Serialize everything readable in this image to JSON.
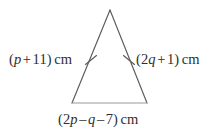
{
  "figure": {
    "type": "geometry-diagram",
    "shape": "isosceles-triangle",
    "background_color": "#ffffff",
    "side_stroke_color": "#5a5a5a",
    "base_stroke_color": "#9a9a9a",
    "text_color": "#2e2e2e",
    "vertices": {
      "apex": [
        110,
        10
      ],
      "bottom_left": [
        72,
        103
      ],
      "bottom_right": [
        147,
        103
      ]
    },
    "tick_marks": [
      {
        "name": "left-side-congruence-tick",
        "position": [
          91,
          60
        ]
      },
      {
        "name": "right-side-congruence-tick",
        "position": [
          129,
          60
        ]
      }
    ]
  },
  "labels": {
    "left_side": {
      "full_text": "(p + 11) cm",
      "open_paren": "(",
      "variable": "p",
      "operator": "+",
      "constant": "11",
      "close_paren": ")",
      "unit": "cm"
    },
    "right_side": {
      "full_text": "(2q + 1) cm",
      "open_paren": "(",
      "coefficient": "2",
      "variable": "q",
      "operator": "+",
      "constant": "1",
      "close_paren": ")",
      "unit": "cm"
    },
    "base": {
      "full_text": "(2p – q – 7) cm",
      "open_paren": "(",
      "coefficient": "2",
      "variable_1": "p",
      "operator_1": "–",
      "variable_2": "q",
      "operator_2": "–",
      "constant": "7",
      "close_paren": ")",
      "unit": "cm"
    }
  }
}
